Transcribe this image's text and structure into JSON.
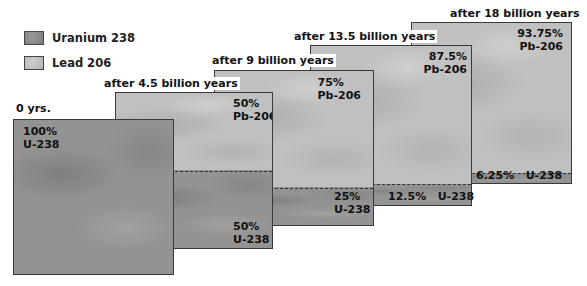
{
  "legend": {
    "items": [
      {
        "label": "Uranium 238",
        "swatch": "uranium-swatch",
        "color": "#939393"
      },
      {
        "label": "Lead 206",
        "swatch": "lead-swatch",
        "color": "#c0c0c0"
      }
    ]
  },
  "panels": [
    {
      "title": "0 yrs.",
      "pb_pct": "",
      "pb_label": "",
      "u_pct": "100%",
      "u_label": "U-238"
    },
    {
      "title": "after 4.5 billion years",
      "pb_pct": "50%",
      "pb_label": "Pb-206",
      "u_pct": "50%",
      "u_label": "U-238"
    },
    {
      "title": "after 9 billion years",
      "pb_pct": "75%",
      "pb_label": "Pb-206",
      "u_pct": "25%",
      "u_label": "U-238"
    },
    {
      "title": "after 13.5 billion years",
      "pb_pct": "87.5%",
      "pb_label": "Pb-206",
      "u_inline": "12.5%   U-238"
    },
    {
      "title": "after 18 billion years",
      "pb_pct": "93.75%",
      "pb_label": "Pb-206",
      "u_inline": "6.25%   U-238"
    }
  ],
  "colors": {
    "uranium": "#939393",
    "lead": "#c0c0c0",
    "border": "#3a3a3a"
  }
}
